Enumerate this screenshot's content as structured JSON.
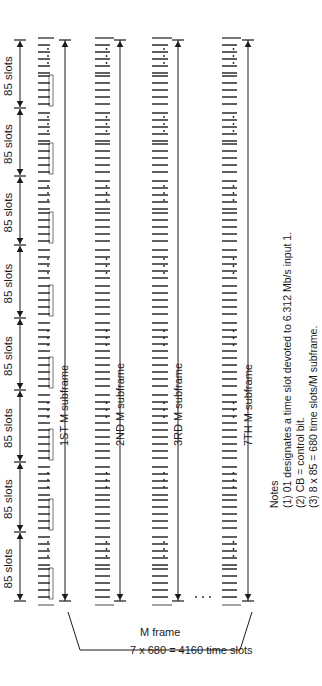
{
  "diagram": {
    "slot_groups": {
      "count": 8,
      "label": "85 slots"
    },
    "rows": [
      {
        "id": "row-1",
        "label": "1ST M subframe",
        "first_slot_marker": "x",
        "cell_text": [
          "CB",
          "01",
          "02",
          "03",
          "04"
        ]
      },
      {
        "id": "row-2",
        "label": "2ND M subframe",
        "first_slot_marker": "x",
        "cell_text": [
          "CB"
        ]
      },
      {
        "id": "row-3",
        "label": "3RD M subframe",
        "first_slot_marker": "F",
        "cell_text": [
          "CB"
        ]
      },
      {
        "id": "row-7",
        "label": "7TH M subframe",
        "first_slot_marker": "M",
        "cell_text": [
          "CB"
        ]
      }
    ],
    "ellipsis": "…",
    "bracket": {
      "line1": "7 x 680 = 4160 time slots",
      "line2": "M frame"
    }
  },
  "notes": {
    "title": "Notes",
    "items": [
      "(1) 01 designates a time slot devoted to 6.312 Mb/s input 1.",
      "(2) CB = control bit.",
      "(3) 8 x 85 = 680 time slots/M subframe."
    ]
  },
  "colors": {
    "ink": "#1a1a1a",
    "background": "#ffffff"
  }
}
